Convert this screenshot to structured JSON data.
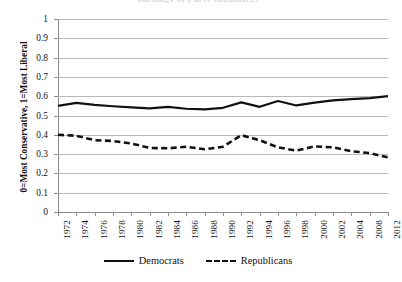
{
  "chart_data": {
    "type": "line",
    "title": "Ideology of Party Identifiers",
    "xlabel": "",
    "ylabel": "0=Most Conservative, 1=Most Liberal",
    "ylim": [
      0,
      1
    ],
    "y_ticks": [
      "1",
      "0.9",
      "0.8",
      "0.7",
      "0.6",
      "0.5",
      "0.4",
      "0.3",
      "0.2",
      "0.1",
      "0"
    ],
    "y_tick_values": [
      1,
      0.9,
      0.8,
      0.7,
      0.6,
      0.5,
      0.4,
      0.3,
      0.2,
      0.1,
      0
    ],
    "grid": true,
    "legend_position": "bottom",
    "x": [
      1972,
      1974,
      1976,
      1978,
      1980,
      1982,
      1984,
      1986,
      1988,
      1990,
      1992,
      1994,
      1996,
      1998,
      2000,
      2002,
      2004,
      2008,
      2012
    ],
    "categories": [
      "1972",
      "1974",
      "1976",
      "1978",
      "1980",
      "1982",
      "1984",
      "1986",
      "1988",
      "1990",
      "1992",
      "1994",
      "1996",
      "1998",
      "2000",
      "2002",
      "2004",
      "2008",
      "2012"
    ],
    "x_tick_labels": [
      "1972",
      "1974",
      "1976",
      "1978",
      "1980",
      "1982",
      "1984",
      "1986",
      "1988",
      "1990",
      "1992",
      "1994",
      "1996",
      "1998",
      "2000",
      "2002",
      "2004",
      "2008",
      "2012"
    ],
    "series": [
      {
        "name": "Democrats",
        "style": "solid",
        "color": "#111111",
        "values": [
          0.55,
          0.565,
          0.555,
          0.548,
          0.542,
          0.537,
          0.545,
          0.535,
          0.532,
          0.54,
          0.568,
          0.545,
          0.575,
          0.552,
          0.567,
          0.578,
          0.585,
          0.59,
          0.6
        ]
      },
      {
        "name": "Republicans",
        "style": "dashed",
        "color": "#111111",
        "values": [
          0.4,
          0.395,
          0.372,
          0.368,
          0.355,
          0.332,
          0.33,
          0.338,
          0.325,
          0.338,
          0.398,
          0.372,
          0.335,
          0.318,
          0.34,
          0.335,
          0.315,
          0.305,
          0.283
        ]
      }
    ]
  },
  "legend": {
    "entries": [
      {
        "label": "Democrats"
      },
      {
        "label": "Republicans"
      }
    ]
  }
}
